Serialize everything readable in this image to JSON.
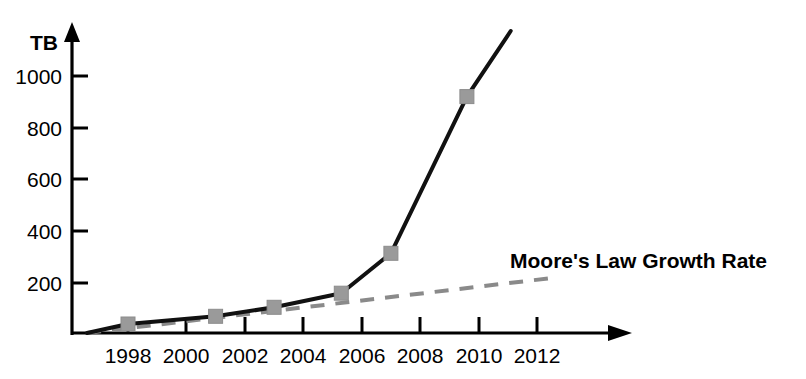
{
  "chart_data": {
    "type": "line",
    "title": "",
    "subtitle": "",
    "xlabel": "",
    "ylabel": "TB",
    "xlim": [
      1996.5,
      2013.7
    ],
    "ylim": [
      0,
      1180
    ],
    "grid": false,
    "legend_position": "inline-annotation",
    "x_ticks": [
      1998,
      2000,
      2002,
      2004,
      2006,
      2008,
      2010,
      2012
    ],
    "x_tick_labels": [
      "1998",
      "2000",
      "2002",
      "2004",
      "2006",
      "2008",
      "2010",
      "2012"
    ],
    "y_ticks": [
      200,
      400,
      600,
      800,
      1000
    ],
    "y_tick_labels": [
      "200",
      "400",
      "600",
      "800",
      "1000"
    ],
    "annotations": [
      {
        "name": "moore-law-annotation",
        "text": "Moore's Law Growth Rate",
        "x": 2011.0,
        "y": 330
      }
    ],
    "series": [
      {
        "name": "Data Growth",
        "style": "solid",
        "color": "#111111",
        "marker": "square",
        "marker_color": "#9a9a9a",
        "x": [
          1996.6,
          1998.0,
          2001.0,
          2003.0,
          2005.3,
          2007.0,
          2009.6,
          2011.1
        ],
        "values": [
          0,
          35,
          65,
          100,
          155,
          310,
          920,
          1175
        ],
        "marker_points": [
          {
            "x": 1998.0,
            "y": 35
          },
          {
            "x": 2001.0,
            "y": 65
          },
          {
            "x": 2003.0,
            "y": 100
          },
          {
            "x": 2005.3,
            "y": 155
          },
          {
            "x": 2007.0,
            "y": 310
          },
          {
            "x": 2009.6,
            "y": 920
          }
        ]
      },
      {
        "name": "Moore's Law Growth Rate",
        "style": "dashed",
        "color": "#8a8a8a",
        "marker": "none",
        "x": [
          1996.6,
          2012.6
        ],
        "values": [
          0,
          215
        ]
      }
    ]
  }
}
